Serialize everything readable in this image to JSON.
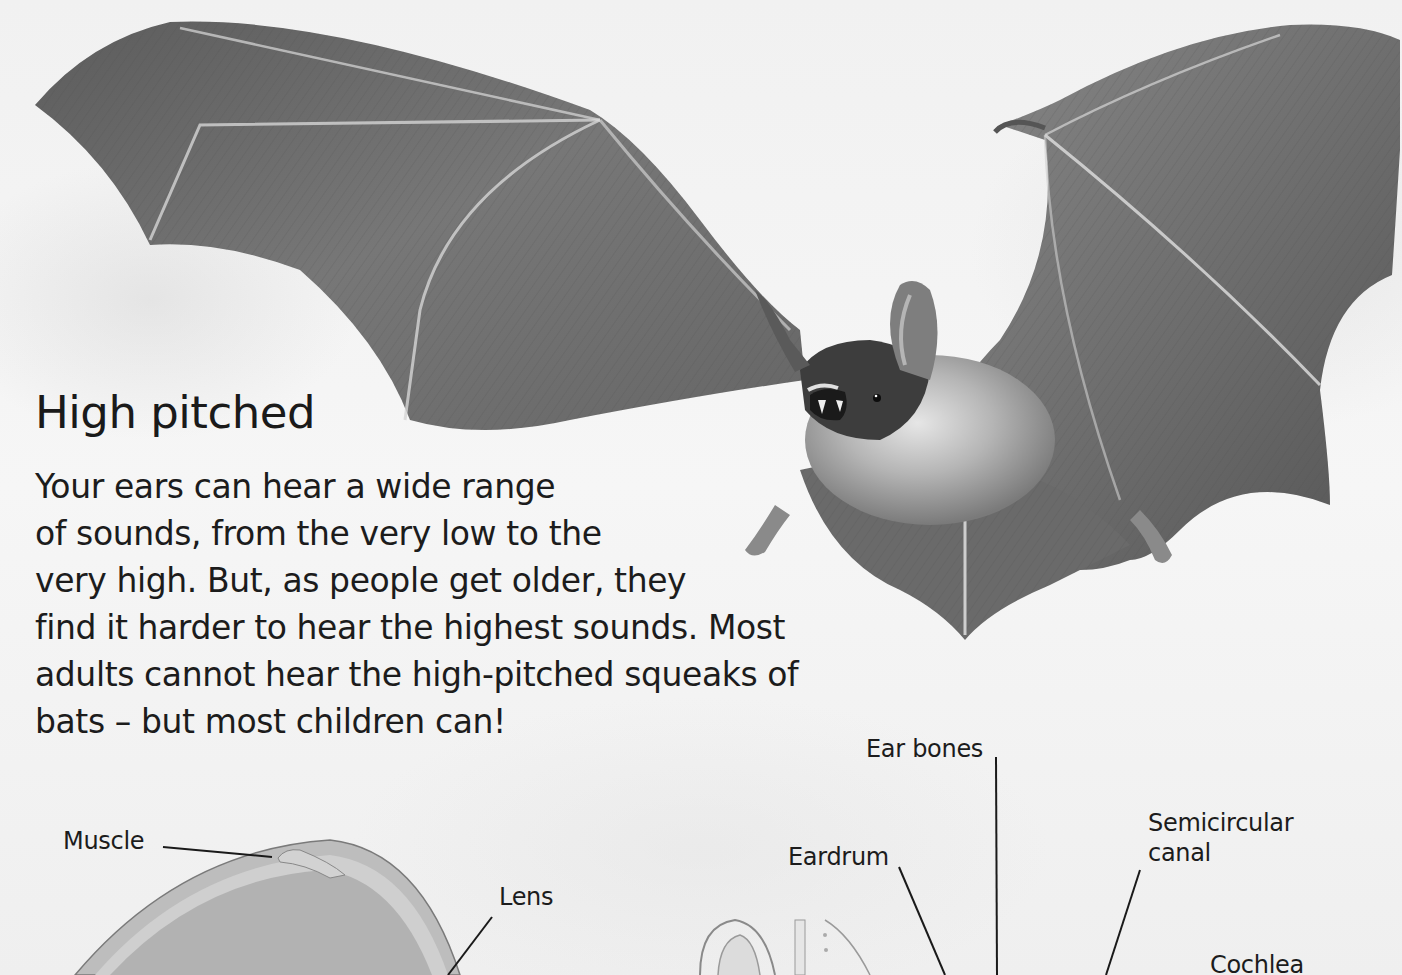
{
  "section": {
    "heading": "High pitched",
    "paragraph_lines": [
      "Your ears can hear a wide range",
      "of sounds, from the very low to the",
      "very high. But, as people get older, they",
      "find it harder to hear the highest sounds. Most",
      "adults cannot hear the high-pitched squeaks of",
      "bats – but most children can!"
    ]
  },
  "photo": {
    "subject": "bat-in-flight",
    "tone": "grayscale"
  },
  "eye_diagram": {
    "labels": {
      "muscle": "Muscle",
      "lens": "Lens"
    }
  },
  "ear_diagram": {
    "labels": {
      "ear_bones": "Ear bones",
      "eardrum": "Eardrum",
      "semicircular_canal_line1": "Semicircular",
      "semicircular_canal_line2": "canal",
      "cochlea": "Cochlea"
    }
  },
  "colors": {
    "page": "#f3f3f3",
    "text": "#1c1c1c",
    "wing": "#6e6e6e",
    "wing_dark": "#4a4a4a",
    "bone": "#d8d8d8",
    "body_fur": "#9a9a9a"
  }
}
